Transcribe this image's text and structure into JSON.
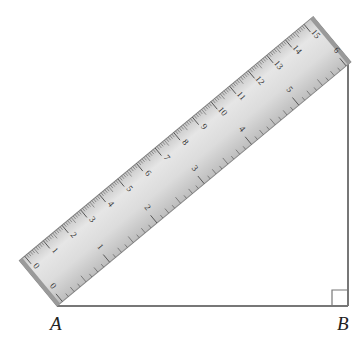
{
  "figure": {
    "type": "right-triangle-with-ruler",
    "points": {
      "A": {
        "label": "A"
      },
      "B": {
        "label": "B"
      }
    },
    "right_angle_at": "B",
    "ruler": {
      "top_scale_unit": "cm",
      "top_scale_labels": [
        "0",
        "1",
        "2",
        "3",
        "4",
        "5",
        "6",
        "7",
        "8",
        "9",
        "10",
        "11",
        "12",
        "13",
        "14",
        "15"
      ],
      "bottom_scale_unit": "inch",
      "bottom_scale_labels": [
        "0",
        "1",
        "2",
        "3",
        "4",
        "5",
        "6"
      ]
    }
  },
  "colors": {
    "ruler_fill": "#d9d9d9",
    "ruler_edge": "#8a8a8a",
    "ticks": "#555555",
    "lines": "#777777",
    "labels": "#222222"
  }
}
